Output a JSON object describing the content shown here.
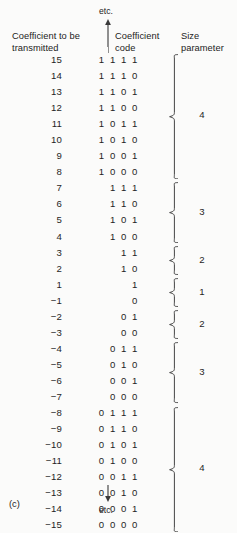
{
  "figure": {
    "panel_label": "(c)",
    "top_continuation": "etc.",
    "bottom_continuation": "etc.",
    "top_arrow_icon": "arrow-up-icon",
    "bottom_arrow_icon": "arrow-down-icon"
  },
  "headers": {
    "coefficient": "Coefficient to be transmitted",
    "code": "Coefficient code",
    "size": "Size parameter"
  },
  "chart_data": {
    "type": "table",
    "columns": [
      "Coefficient to be transmitted",
      "Coefficient code",
      "Size parameter"
    ],
    "rows": [
      {
        "coefficient": "15",
        "code": "1 1 1 1",
        "size": "4"
      },
      {
        "coefficient": "14",
        "code": "1 1 1 0",
        "size": "4"
      },
      {
        "coefficient": "13",
        "code": "1 1 0 1",
        "size": "4"
      },
      {
        "coefficient": "12",
        "code": "1 1 0 0",
        "size": "4"
      },
      {
        "coefficient": "11",
        "code": "1 0 1 1",
        "size": "4"
      },
      {
        "coefficient": "10",
        "code": "1 0 1 0",
        "size": "4"
      },
      {
        "coefficient": "9",
        "code": "1 0 0 1",
        "size": "4"
      },
      {
        "coefficient": "8",
        "code": "1 0 0 0",
        "size": "4"
      },
      {
        "coefficient": "7",
        "code": "1 1 1",
        "size": "3"
      },
      {
        "coefficient": "6",
        "code": "1 1 0",
        "size": "3"
      },
      {
        "coefficient": "5",
        "code": "1 0 1",
        "size": "3"
      },
      {
        "coefficient": "4",
        "code": "1 0 0",
        "size": "3"
      },
      {
        "coefficient": "3",
        "code": "1 1",
        "size": "2"
      },
      {
        "coefficient": "2",
        "code": "1 0",
        "size": "2"
      },
      {
        "coefficient": "1",
        "code": "1",
        "size": "1"
      },
      {
        "coefficient": "−1",
        "code": "0",
        "size": "1"
      },
      {
        "coefficient": "−2",
        "code": "0 1",
        "size": "2"
      },
      {
        "coefficient": "−3",
        "code": "0 0",
        "size": "2"
      },
      {
        "coefficient": "−4",
        "code": "0 1 1",
        "size": "3"
      },
      {
        "coefficient": "−5",
        "code": "0 1 0",
        "size": "3"
      },
      {
        "coefficient": "−6",
        "code": "0 0 1",
        "size": "3"
      },
      {
        "coefficient": "−7",
        "code": "0 0 0",
        "size": "3"
      },
      {
        "coefficient": "−8",
        "code": "0 1 1 1",
        "size": "4"
      },
      {
        "coefficient": "−9",
        "code": "0 1 1 0",
        "size": "4"
      },
      {
        "coefficient": "−10",
        "code": "0 1 0 1",
        "size": "4"
      },
      {
        "coefficient": "−11",
        "code": "0 1 0 0",
        "size": "4"
      },
      {
        "coefficient": "−12",
        "code": "0 0 1 1",
        "size": "4"
      },
      {
        "coefficient": "−13",
        "code": "0 0 1 0",
        "size": "4"
      },
      {
        "coefficient": "−14",
        "code": "0 0 0 1",
        "size": "4"
      },
      {
        "coefficient": "−15",
        "code": "0 0 0 0",
        "size": "4"
      }
    ],
    "groups": [
      {
        "size": "4",
        "first_row": 0,
        "last_row": 7,
        "coefficient_range": "15 to 8"
      },
      {
        "size": "3",
        "first_row": 8,
        "last_row": 11,
        "coefficient_range": "7 to 4"
      },
      {
        "size": "2",
        "first_row": 12,
        "last_row": 13,
        "coefficient_range": "3 to 2"
      },
      {
        "size": "1",
        "first_row": 14,
        "last_row": 15,
        "coefficient_range": "1 to −1"
      },
      {
        "size": "2",
        "first_row": 16,
        "last_row": 17,
        "coefficient_range": "−2 to −3"
      },
      {
        "size": "3",
        "first_row": 18,
        "last_row": 21,
        "coefficient_range": "−4 to −7"
      },
      {
        "size": "4",
        "first_row": 22,
        "last_row": 29,
        "coefficient_range": "−8 to −15"
      }
    ]
  },
  "colors": {
    "background": "#fbfbfa",
    "text": "#1f1f1f",
    "rule": "#8f8f8f"
  }
}
